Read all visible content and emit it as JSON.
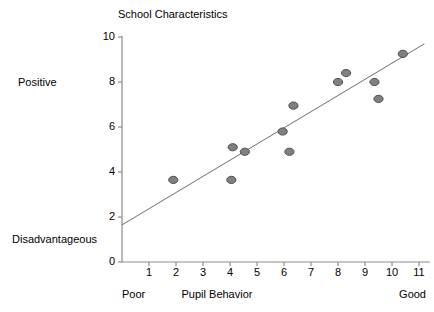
{
  "chart_data": {
    "type": "scatter",
    "title": "School Characteristics",
    "xlabel": "Pupil Behavior",
    "ylabel": "",
    "xlim": [
      0,
      11
    ],
    "ylim": [
      0,
      10
    ],
    "grid": false,
    "legend": "none",
    "x_ticks": [
      "1",
      "2",
      "3",
      "4",
      "5",
      "6",
      "7",
      "8",
      "9",
      "10",
      "11"
    ],
    "y_ticks": [
      "0",
      "2",
      "4",
      "6",
      "8",
      "10"
    ],
    "x_axis_low_label": "Poor",
    "x_axis_high_label": "Good",
    "y_axis_high_label": "Positive",
    "y_axis_low_label": "Disadvantageous",
    "marker_color": "#808080",
    "marker_edge_color": "#4d4d4d",
    "line_color": "#6e6e6e",
    "axis_color": "#8c8c8c",
    "points": [
      {
        "x": 1.9,
        "y": 3.65
      },
      {
        "x": 4.05,
        "y": 3.65
      },
      {
        "x": 4.1,
        "y": 5.1
      },
      {
        "x": 4.55,
        "y": 4.9
      },
      {
        "x": 5.95,
        "y": 5.8
      },
      {
        "x": 6.2,
        "y": 4.9
      },
      {
        "x": 6.35,
        "y": 6.95
      },
      {
        "x": 8.0,
        "y": 8.0
      },
      {
        "x": 8.3,
        "y": 8.4
      },
      {
        "x": 9.35,
        "y": 8.0
      },
      {
        "x": 9.5,
        "y": 7.25
      },
      {
        "x": 10.4,
        "y": 9.25
      }
    ],
    "trend_line": {
      "x0": 0.0,
      "y0": 1.65,
      "x1": 11.2,
      "y1": 9.7
    }
  }
}
